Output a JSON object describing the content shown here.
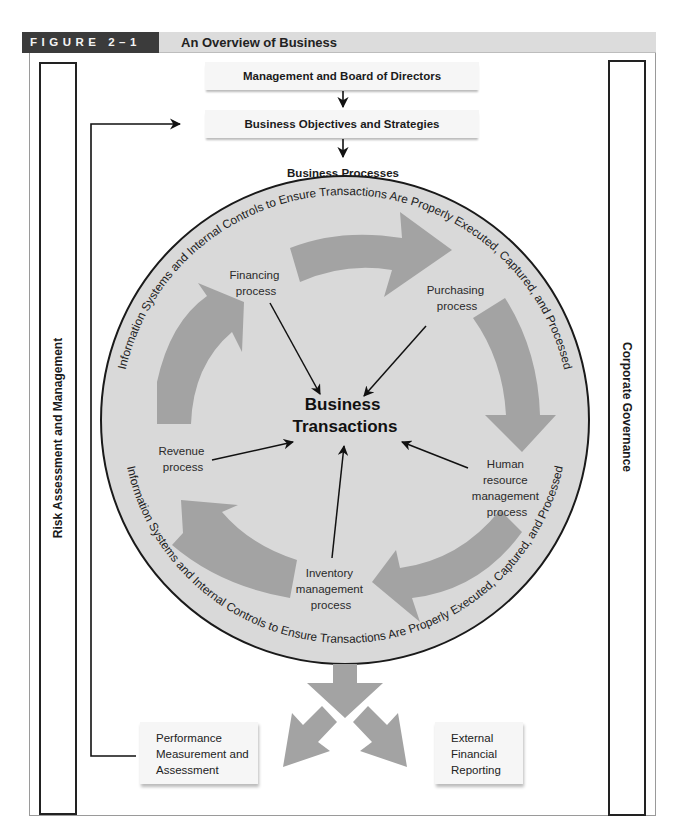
{
  "figure": {
    "label": "FIGURE 2–1",
    "title": "An Overview of Business"
  },
  "side_panels": {
    "left": "Risk Assessment and Management",
    "right": "Corporate Governance"
  },
  "top_boxes": [
    "Management and Board of Directors",
    "Business Objectives and Strategies"
  ],
  "business_processes_label": "Business Processes",
  "ring_text": {
    "top": "Information Systems and Internal Controls to Ensure Transactions Are Properly Executed, Captured, and Processed",
    "bottom": "Information Systems and Internal Controls to Ensure Transactions Are Properly Executed, Captured, and Processed"
  },
  "center_label": [
    "Business",
    "Transactions"
  ],
  "processes": [
    {
      "id": "financing",
      "lines": [
        "Financing",
        "process"
      ]
    },
    {
      "id": "purchasing",
      "lines": [
        "Purchasing",
        "process"
      ]
    },
    {
      "id": "human-resource",
      "lines": [
        "Human",
        "resource",
        "management",
        "process"
      ]
    },
    {
      "id": "inventory",
      "lines": [
        "Inventory",
        "management",
        "process"
      ]
    },
    {
      "id": "revenue",
      "lines": [
        "Revenue",
        "process"
      ]
    }
  ],
  "outputs": [
    {
      "id": "performance",
      "lines": [
        "Performance",
        "Measurement and",
        "Assessment"
      ]
    },
    {
      "id": "external",
      "lines": [
        "External",
        "Financial",
        "Reporting"
      ]
    }
  ],
  "colors": {
    "header_dark": "#3b3b3b",
    "header_light": "#dcdcdc",
    "circle_fill": "#d9d9d9",
    "arrow_fill": "#a3a3a3",
    "box_fill": "#f6f6f6"
  }
}
